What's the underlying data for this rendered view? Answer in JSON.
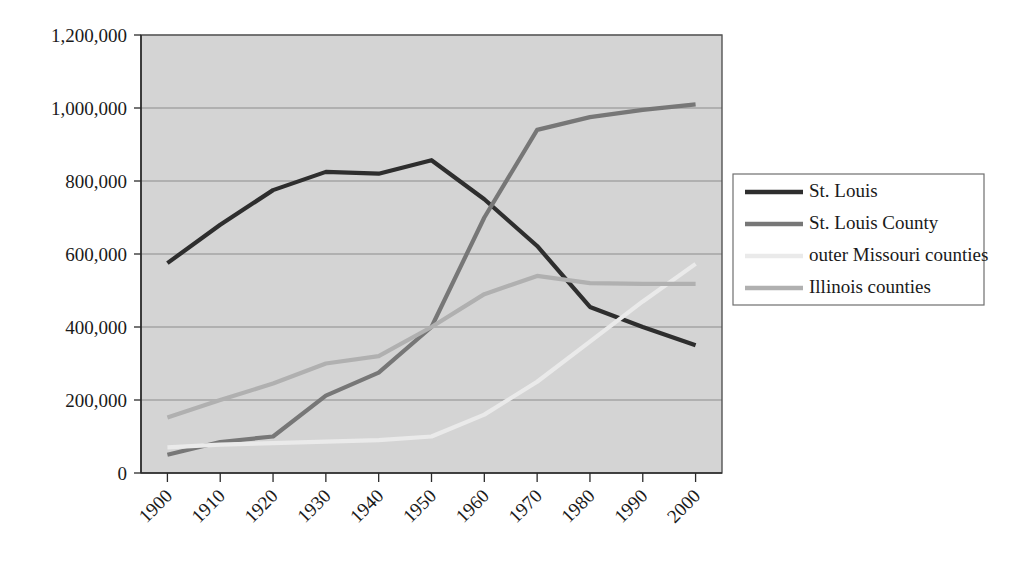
{
  "chart_data": {
    "type": "line",
    "title": "",
    "subtitle": "",
    "xlabel": "",
    "ylabel": "",
    "x": [
      1900,
      1910,
      1920,
      1930,
      1940,
      1950,
      1960,
      1970,
      1980,
      1990,
      2000
    ],
    "x_tick_labels": [
      "1900",
      "1910",
      "1920",
      "1930",
      "1940",
      "1950",
      "1960",
      "1970",
      "1980",
      "1990",
      "2000"
    ],
    "y_tick_labels": [
      "0",
      "200,000",
      "400,000",
      "600,000",
      "800,000",
      "1,000,000",
      "1,200,000"
    ],
    "y_ticks": [
      0,
      200000,
      400000,
      600000,
      800000,
      1000000,
      1200000
    ],
    "xlim": [
      1895,
      2005
    ],
    "ylim": [
      0,
      1200000
    ],
    "grid": true,
    "legend_position": "right",
    "plot_background": "#d4d4d4",
    "series": [
      {
        "name": "St. Louis",
        "color": "#2e2e2e",
        "width": 4.2,
        "values": [
          575000,
          680000,
          775000,
          825000,
          820000,
          857000,
          750000,
          622000,
          455000,
          400000,
          350000
        ]
      },
      {
        "name": "St. Louis County",
        "color": "#777777",
        "width": 4.2,
        "values": [
          50000,
          85000,
          100000,
          212000,
          275000,
          400000,
          700000,
          940000,
          975000,
          995000,
          1010000
        ]
      },
      {
        "name": "outer Missouri counties",
        "color": "#eaeaea",
        "width": 4.2,
        "values": [
          70000,
          78000,
          82000,
          86000,
          90000,
          100000,
          160000,
          250000,
          360000,
          470000,
          573000
        ]
      },
      {
        "name": "Illinois counties",
        "color": "#b0b0b0",
        "width": 4.2,
        "values": [
          152000,
          200000,
          245000,
          300000,
          320000,
          400000,
          490000,
          540000,
          520000,
          518000,
          518000
        ]
      }
    ]
  },
  "legend": {
    "entries": [
      {
        "label": "St. Louis",
        "color": "#2e2e2e"
      },
      {
        "label": "St. Louis County",
        "color": "#777777"
      },
      {
        "label": "outer Missouri counties",
        "color": "#eaeaea"
      },
      {
        "label": "Illinois counties",
        "color": "#b0b0b0"
      }
    ]
  }
}
